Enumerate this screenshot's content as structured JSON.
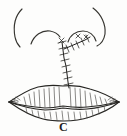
{
  "figure": {
    "caption_label": "C",
    "panel_id": "C",
    "style": "pen-and-ink line drawing",
    "ink_color": "#262522",
    "background_color": "#fdfdfc",
    "parts": [
      {
        "name": "left-alar-arc",
        "label": "Left nostril alar rim",
        "icon": "arc-icon"
      },
      {
        "name": "left-nostril-sill-arc",
        "label": "Left nostril sill",
        "icon": "arc-icon"
      },
      {
        "name": "right-alar-arc",
        "label": "Right nostril alar rim",
        "icon": "arc-icon"
      },
      {
        "name": "right-nostril-sill-arc",
        "label": "Right nostril sill",
        "icon": "arc-icon"
      },
      {
        "name": "nasal-sill-suture",
        "label": "Nasal sill suture line",
        "icon": "suture-icon"
      },
      {
        "name": "philtral-suture",
        "label": "Philtral column suture line",
        "icon": "suture-icon"
      },
      {
        "name": "upper-lip",
        "label": "Upper lip with vermillion hatching",
        "icon": "lip-icon"
      },
      {
        "name": "lower-lip",
        "label": "Lower lip with vermillion hatching",
        "icon": "lip-icon"
      },
      {
        "name": "left-commissure",
        "label": "Left oral commissure",
        "icon": "corner-icon"
      },
      {
        "name": "right-commissure",
        "label": "Right oral commissure",
        "icon": "corner-icon"
      }
    ]
  }
}
